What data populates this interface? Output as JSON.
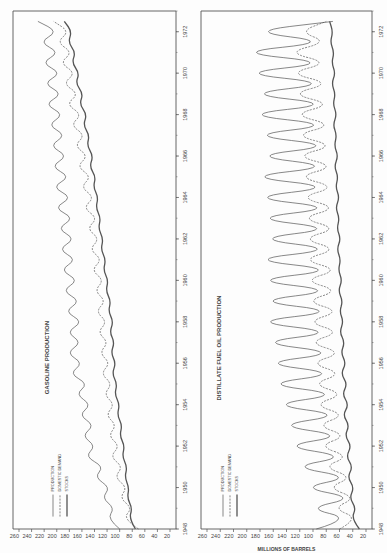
{
  "page": {
    "orientation": "rotated 90 degrees counter-clockwise",
    "ink_color": "#555555"
  },
  "chart_data": [
    {
      "type": "line",
      "title": "GASOLINE PRODUCTION",
      "xlabel": "",
      "ylabel": "",
      "x_ticks": [
        "1948",
        "1950",
        "1952",
        "1954",
        "1956",
        "1958",
        "1960",
        "1962",
        "1964",
        "1966",
        "1968",
        "1970",
        "1972"
      ],
      "y_ticks": [
        20,
        40,
        60,
        80,
        100,
        120,
        140,
        160,
        180,
        200,
        220,
        240,
        260
      ],
      "xlim": [
        1948,
        1973
      ],
      "ylim": [
        20,
        260
      ],
      "grid": false,
      "legend": {
        "position": "upper-left",
        "entries": [
          {
            "label": "PRODUCTION",
            "style": "solid-thin"
          },
          {
            "label": "DOMESTIC DEMAND",
            "style": "dashed"
          },
          {
            "label": "STOCKS",
            "style": "solid-thick"
          }
        ]
      },
      "x": [
        1948.0,
        1948.5,
        1949.0,
        1949.5,
        1950.0,
        1950.5,
        1951.0,
        1951.5,
        1952.0,
        1952.5,
        1953.0,
        1953.5,
        1954.0,
        1954.5,
        1955.0,
        1955.5,
        1956.0,
        1956.5,
        1957.0,
        1957.5,
        1958.0,
        1958.5,
        1959.0,
        1959.5,
        1960.0,
        1960.5,
        1961.0,
        1961.5,
        1962.0,
        1962.5,
        1963.0,
        1963.5,
        1964.0,
        1964.5,
        1965.0,
        1965.5,
        1966.0,
        1966.5,
        1967.0,
        1967.5,
        1968.0,
        1968.5,
        1969.0,
        1969.5,
        1970.0,
        1970.5,
        1971.0,
        1971.5,
        1972.0,
        1972.5
      ],
      "series": [
        {
          "name": "PRODUCTION",
          "values": [
            100,
            120,
            108,
            128,
            115,
            140,
            125,
            155,
            138,
            160,
            140,
            165,
            145,
            170,
            150,
            180,
            158,
            185,
            160,
            185,
            158,
            188,
            162,
            192,
            165,
            195,
            168,
            198,
            170,
            200,
            172,
            205,
            175,
            208,
            178,
            210,
            182,
            212,
            185,
            215,
            188,
            220,
            190,
            222,
            192,
            225,
            195,
            228,
            198,
            230
          ]
        },
        {
          "name": "DOMESTIC DEMAND",
          "values": [
            70,
            95,
            80,
            100,
            88,
            108,
            95,
            115,
            100,
            118,
            105,
            122,
            108,
            125,
            112,
            130,
            115,
            132,
            118,
            135,
            120,
            138,
            122,
            140,
            125,
            145,
            128,
            148,
            132,
            152,
            135,
            158,
            140,
            162,
            145,
            168,
            150,
            172,
            155,
            178,
            160,
            185,
            165,
            190,
            170,
            195,
            175,
            200,
            180,
            205
          ]
        },
        {
          "name": "STOCKS",
          "values": [
            75,
            85,
            80,
            88,
            85,
            92,
            88,
            96,
            92,
            100,
            96,
            104,
            100,
            108,
            104,
            112,
            106,
            114,
            108,
            116,
            110,
            118,
            114,
            122,
            118,
            126,
            122,
            130,
            126,
            134,
            130,
            138,
            134,
            142,
            138,
            148,
            142,
            152,
            148,
            158,
            152,
            164,
            158,
            170,
            164,
            176,
            170,
            182,
            176,
            188
          ]
        }
      ]
    },
    {
      "type": "line",
      "title": "DISTILLATE FUEL OIL PRODUCTION",
      "xlabel": "",
      "ylabel": "MILLIONS OF BARRELS",
      "x_ticks": [
        "1948",
        "1950",
        "1952",
        "1954",
        "1956",
        "1958",
        "1960",
        "1962",
        "1964",
        "1966",
        "1968",
        "1970",
        "1972"
      ],
      "y_ticks": [
        20,
        40,
        60,
        80,
        100,
        120,
        140,
        160,
        180,
        200,
        220,
        240,
        260
      ],
      "xlim": [
        1948,
        1973
      ],
      "ylim": [
        20,
        260
      ],
      "grid": false,
      "legend": {
        "position": "upper-left",
        "entries": [
          {
            "label": "PRODUCTION",
            "style": "solid-thin"
          },
          {
            "label": "DOMESTIC DEMAND",
            "style": "dashed"
          },
          {
            "label": "STOCKS",
            "style": "solid-thick"
          }
        ]
      },
      "x": [
        1948.0,
        1948.5,
        1949.0,
        1949.5,
        1950.0,
        1950.5,
        1951.0,
        1951.5,
        1952.0,
        1952.5,
        1953.0,
        1953.5,
        1954.0,
        1954.5,
        1955.0,
        1955.5,
        1956.0,
        1956.5,
        1957.0,
        1957.5,
        1958.0,
        1958.5,
        1959.0,
        1959.5,
        1960.0,
        1960.5,
        1961.0,
        1961.5,
        1962.0,
        1962.5,
        1963.0,
        1963.5,
        1964.0,
        1964.5,
        1965.0,
        1965.5,
        1966.0,
        1966.5,
        1967.0,
        1967.5,
        1968.0,
        1968.5,
        1969.0,
        1969.5,
        1970.0,
        1970.5,
        1971.0,
        1971.5,
        1972.0,
        1972.5
      ],
      "series": [
        {
          "name": "PRODUCTION",
          "values": [
            95,
            40,
            110,
            35,
            120,
            40,
            135,
            45,
            150,
            48,
            160,
            50,
            170,
            52,
            180,
            55,
            185,
            55,
            190,
            58,
            200,
            55,
            195,
            58,
            200,
            55,
            205,
            58,
            195,
            60,
            200,
            58,
            205,
            60,
            210,
            62,
            200,
            60,
            205,
            62,
            215,
            62,
            210,
            65,
            220,
            65,
            225,
            68,
            200,
            70
          ]
        },
        {
          "name": "DOMESTIC DEMAND",
          "values": [
            60,
            30,
            70,
            35,
            78,
            40,
            85,
            45,
            92,
            48,
            95,
            50,
            100,
            52,
            102,
            55,
            105,
            55,
            108,
            58,
            110,
            58,
            112,
            60,
            115,
            60,
            118,
            62,
            118,
            62,
            120,
            62,
            122,
            64,
            125,
            65,
            128,
            66,
            130,
            68,
            132,
            70,
            135,
            72,
            138,
            75,
            140,
            78,
            120,
            80
          ]
        },
        {
          "name": "STOCKS",
          "values": [
            30,
            42,
            35,
            45,
            38,
            48,
            40,
            50,
            42,
            52,
            45,
            55,
            46,
            56,
            48,
            58,
            50,
            58,
            52,
            60,
            54,
            60,
            55,
            62,
            56,
            62,
            58,
            64,
            58,
            64,
            60,
            66,
            60,
            66,
            62,
            68,
            62,
            68,
            64,
            70,
            64,
            70,
            66,
            72,
            66,
            72,
            68,
            74,
            70,
            75
          ]
        }
      ]
    }
  ]
}
